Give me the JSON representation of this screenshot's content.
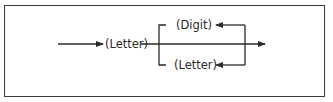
{
  "diagram": {
    "type": "syntax-diagram",
    "nodes": {
      "start_letter": "(Letter)",
      "loop_digit": "(Digit)",
      "loop_letter": "(Letter)"
    },
    "colors": {
      "line": "#2a2a2a",
      "border": "#3a3a3a",
      "background": "#ffffff"
    }
  }
}
